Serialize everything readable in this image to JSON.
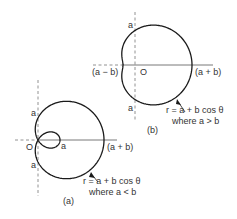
{
  "colors": {
    "curve": "#1a1a1a",
    "axis": "#555555",
    "dashed": "#777777",
    "text": "#333333",
    "background": "#ffffff"
  },
  "figure_a": {
    "caption": "(a)",
    "origin_label": "O",
    "top_a_label": "a",
    "bottom_a_label": "a",
    "inner_a_label": "a",
    "right_label": "(a + b)",
    "equation": "r = a + b cos θ",
    "condition": "where a < b",
    "params": {
      "cx": 38,
      "cy": 140,
      "a": 22,
      "b": 44
    }
  },
  "figure_b": {
    "caption": "(b)",
    "origin_label": "O",
    "top_a_label": "a",
    "bottom_a_label": "a",
    "left_label": "(a − b)",
    "right_label": "(a + b)",
    "equation": "r = a + b cos θ",
    "condition": "where a > b",
    "params": {
      "cx": 135,
      "cy": 65,
      "a": 34.5,
      "b": 22.5
    }
  }
}
